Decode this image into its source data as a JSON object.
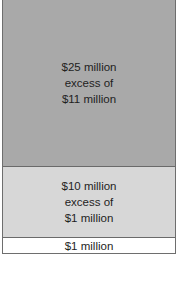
{
  "diagram": {
    "type": "insurance-layer-tower",
    "layers": [
      {
        "lines": [
          "$25 million",
          "excess of",
          "$11 million"
        ],
        "fill": "#a9a9a9"
      },
      {
        "lines": [
          "$10 million",
          "excess of",
          "$1 million"
        ],
        "fill": "#d7d7d7"
      },
      {
        "lines": [
          "$1 million"
        ],
        "fill": "#ffffff"
      }
    ],
    "border_color": "#6a6a6a"
  }
}
